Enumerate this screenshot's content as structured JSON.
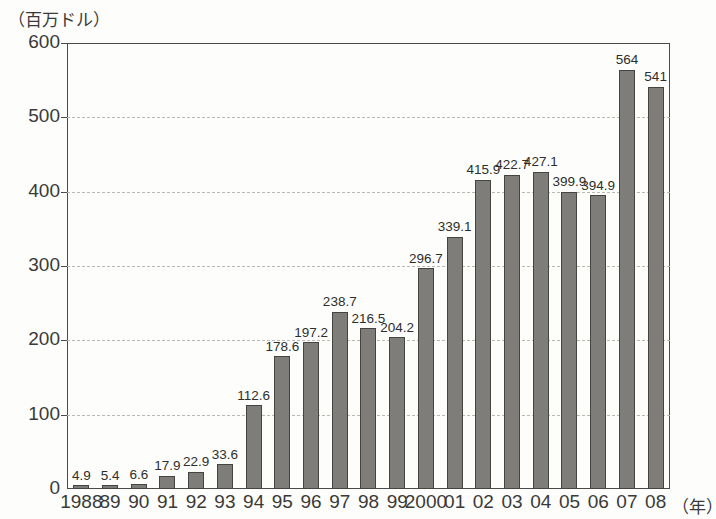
{
  "chart_data": {
    "type": "bar",
    "title": "",
    "subtitle": "",
    "xlabel": "（年）",
    "ylabel": "（百万ドル）",
    "unit_note": "（百万ドル）",
    "categories": [
      "1988",
      "89",
      "90",
      "91",
      "92",
      "93",
      "94",
      "95",
      "96",
      "97",
      "98",
      "99",
      "2000",
      "01",
      "02",
      "03",
      "04",
      "05",
      "06",
      "07",
      "08"
    ],
    "values": [
      4.9,
      5.4,
      6.6,
      17.9,
      22.9,
      33.6,
      112.6,
      178.6,
      197.2,
      238.7,
      216.5,
      204.2,
      296.7,
      339.1,
      415.9,
      422.7,
      427.1,
      399.9,
      394.9,
      564,
      541
    ],
    "data_labels": [
      "4.9",
      "5.4",
      "6.6",
      "17.9",
      "22.9",
      "33.6",
      "112.6",
      "178.6",
      "197.2",
      "238.7",
      "216.5",
      "204.2",
      "296.7",
      "339.1",
      "415.9",
      "422.7",
      "427.1",
      "399.9",
      "394.9",
      "564",
      "541"
    ],
    "ylim": [
      0,
      600
    ],
    "yticks": [
      0,
      100,
      200,
      300,
      400,
      500,
      600
    ],
    "ytick_labels": [
      "0",
      "100",
      "200",
      "300",
      "400",
      "500",
      "600"
    ],
    "grid": true,
    "grid_style": "dashed-horizontal",
    "legend": "none",
    "legend_position": "none",
    "series": [
      {
        "name": "",
        "values": [
          4.9,
          5.4,
          6.6,
          17.9,
          22.9,
          33.6,
          112.6,
          178.6,
          197.2,
          238.7,
          216.5,
          204.2,
          296.7,
          339.1,
          415.9,
          422.7,
          427.1,
          399.9,
          394.9,
          564,
          541
        ]
      }
    ],
    "colors": {
      "bar_fill": "#7e7d79",
      "bar_stroke": "#454441",
      "axis": "#4a4a48",
      "grid": "#b9b9b4",
      "text": "#2e2e2c",
      "background": "#fdfdfb"
    }
  }
}
